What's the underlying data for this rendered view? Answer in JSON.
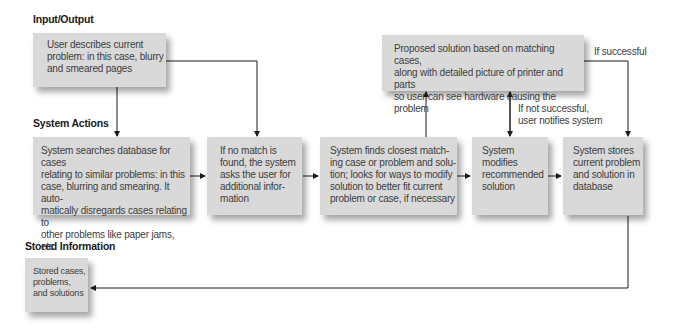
{
  "diagram": {
    "sections": {
      "input_output": "Input/Output",
      "system_actions": "System Actions",
      "stored_information": "Stored Information"
    },
    "boxes": {
      "user_describes": "User describes current\nproblem: in this case, blurry\nand smeared pages",
      "proposed_solution": "Proposed solution based on matching cases,\nalong with detailed picture of printer and parts\nso user can see hardware causing the problem",
      "system_searches": "System searches database for cases\nrelating to similar problems: in this\ncase, blurring and smearing. It auto-\nmatically disregards cases relating to\nother problems like paper jams, etc.",
      "no_match": "If no match is\nfound, the system\nasks the user for\nadditional infor-\nmation",
      "system_finds": "System finds closest match-\ning case or problem and solu-\ntion; looks for ways to modify\nsolution to better fit current\nproblem or case, if necessary",
      "system_modifies": "System\nmodifies\nrecommended\nsolution",
      "system_stores": "System stores\ncurrent problem\nand solution in\ndatabase",
      "stored_cases": "Stored cases,\nproblems,\nand solutions"
    },
    "edge_labels": {
      "if_successful": "If successful",
      "if_not_successful": "If not successful,\nuser notifies system"
    },
    "colors": {
      "box_fill": "#d9d9d9",
      "line": "#1a1a1a",
      "text": "#404040"
    }
  }
}
